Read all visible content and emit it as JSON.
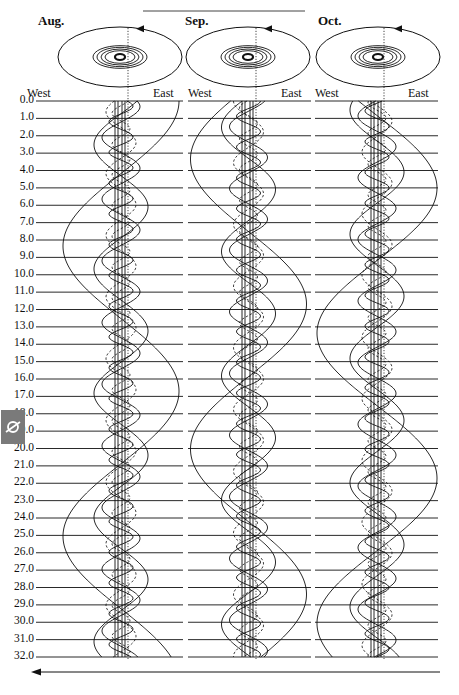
{
  "figure": {
    "type": "orbit-track diagram",
    "months": [
      {
        "label": "Aug.",
        "west_label": "West",
        "east_label": "East"
      },
      {
        "label": "Sep.",
        "west_label": "West",
        "east_label": "East"
      },
      {
        "label": "Oct.",
        "west_label": "West",
        "east_label": "East"
      }
    ],
    "row_labels": [
      "0.0",
      "1.0",
      "2.0",
      "3.0",
      "4.0",
      "5.0",
      "6.0",
      "7.0",
      "8.0",
      "9.0",
      "10.0",
      "11.0",
      "12.0",
      "13.0",
      "14.0",
      "15.0",
      "16.0",
      "17.0",
      "18.0",
      "19.0",
      "20.0",
      "21.0",
      "22.0",
      "23.0",
      "24.0",
      "25.0",
      "26.0",
      "27.0",
      "28.0",
      "29.0",
      "30.0",
      "31.0",
      "32.0"
    ],
    "side_badge_icon": "planet-ring-icon",
    "bottom_arrow_direction": "left",
    "orbit_arrow_direction": "counterclockwise",
    "colors": {
      "ink": "#111111",
      "badge": "#7a7a7a",
      "badge_icon": "#ffffff",
      "background": "#ffffff"
    }
  }
}
